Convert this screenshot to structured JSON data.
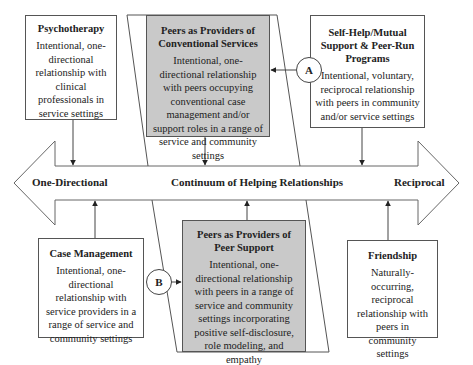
{
  "continuum": {
    "left_label": "One-Directional",
    "center_label": "Continuum of Helping Relationships",
    "right_label": "Reciprocal"
  },
  "boxes": {
    "psychotherapy": {
      "title": "Psychotherapy",
      "description": "Intentional, one-directional relationship with clinical professionals in service settings"
    },
    "peers_conventional": {
      "title": "Peers as Providers of Conventional Services",
      "description": "Intentional, one-directional relationship with peers occupying conventional case management and/or support roles in a range of service and community settings"
    },
    "self_help": {
      "title": "Self-Help/Mutual Support & Peer-Run Programs",
      "description": "Intentional, voluntary, reciprocal relationship with peers in community and/or service settings"
    },
    "case_management": {
      "title": "Case Management",
      "description": "Intentional, one-directional relationship with service providers in a range of service and community settings"
    },
    "peers_support": {
      "title": "Peers as Providers of Peer Support",
      "description": "Intentional, one-directional relationship with peers in a range of service and community settings incorporating positive self-disclosure, role modeling, and empathy"
    },
    "friendship": {
      "title": "Friendship",
      "description": "Naturally-occurring, reciprocal relationship with peers in community settings"
    }
  },
  "markers": {
    "a": "A",
    "b": "B"
  },
  "colors": {
    "shaded_fill": "#c9c9c9",
    "line": "#555555",
    "background": "#ffffff"
  }
}
